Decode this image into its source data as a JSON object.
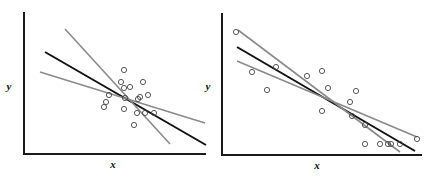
{
  "chart_data": [
    {
      "type": "scatter",
      "title": "",
      "xlabel": "x",
      "ylabel": "y",
      "grid": false,
      "legend": null,
      "frame": {
        "x0": 24,
        "y0": 154,
        "x1": 206,
        "ytop": 12
      },
      "label_pos": {
        "x": [
          113,
          168
        ],
        "y": [
          9,
          90
        ]
      },
      "points": [
        [
          124,
          70
        ],
        [
          121,
          82
        ],
        [
          130,
          87
        ],
        [
          124,
          88
        ],
        [
          143,
          82
        ],
        [
          148,
          95
        ],
        [
          140,
          97
        ],
        [
          138,
          99
        ],
        [
          125,
          98
        ],
        [
          109,
          95
        ],
        [
          106,
          102
        ],
        [
          104,
          107
        ],
        [
          124,
          109
        ],
        [
          137,
          113
        ],
        [
          145,
          113
        ],
        [
          154,
          113
        ],
        [
          134,
          125
        ]
      ],
      "lines": [
        {
          "name": "fit-black",
          "color": "#111111",
          "width": 2,
          "from": [
            45,
            52
          ],
          "to": [
            206,
            145
          ]
        },
        {
          "name": "fit-gray-steep",
          "color": "#8a8a8a",
          "width": 1.6,
          "from": [
            65,
            29
          ],
          "to": [
            170,
            144
          ]
        },
        {
          "name": "fit-gray-shallow",
          "color": "#8a8a8a",
          "width": 1.6,
          "from": [
            40,
            72
          ],
          "to": [
            205,
            123
          ]
        }
      ]
    },
    {
      "type": "scatter",
      "title": "",
      "xlabel": "x",
      "ylabel": "y",
      "grid": false,
      "legend": null,
      "frame": {
        "x0": 222,
        "y0": 155,
        "x1": 422,
        "ytop": 13
      },
      "label_pos": {
        "x": [
          317,
          169
        ],
        "y": [
          208,
          90
        ]
      },
      "points": [
        [
          236,
          32
        ],
        [
          252,
          72
        ],
        [
          276,
          67
        ],
        [
          267,
          90
        ],
        [
          307,
          76
        ],
        [
          322,
          71
        ],
        [
          328,
          88
        ],
        [
          322,
          111
        ],
        [
          356,
          91
        ],
        [
          350,
          102
        ],
        [
          352,
          116
        ],
        [
          365,
          125
        ],
        [
          365,
          144
        ],
        [
          380,
          144
        ],
        [
          388,
          144
        ],
        [
          391,
          144
        ],
        [
          400,
          144
        ],
        [
          417,
          139
        ]
      ],
      "lines": [
        {
          "name": "fit-black",
          "color": "#111111",
          "width": 2,
          "from": [
            237,
            47
          ],
          "to": [
            415,
            151
          ]
        },
        {
          "name": "fit-gray-steep",
          "color": "#8a8a8a",
          "width": 1.6,
          "from": [
            238,
            30
          ],
          "to": [
            400,
            152
          ]
        },
        {
          "name": "fit-gray-shallow",
          "color": "#8a8a8a",
          "width": 1.6,
          "from": [
            237,
            61
          ],
          "to": [
            417,
            137
          ]
        }
      ]
    }
  ]
}
